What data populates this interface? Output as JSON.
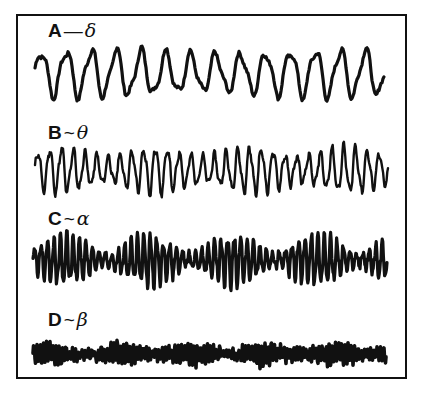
{
  "figure": {
    "line_color": "#111111",
    "background": "#ffffff",
    "frame_color": "#111111"
  },
  "traces": [
    {
      "letter": "A",
      "separator": "—",
      "greek": "δ",
      "name": "delta",
      "frequency": "lowest",
      "amplitude": "large",
      "cycles": 14
    },
    {
      "letter": "B",
      "separator": "~",
      "greek": "θ",
      "name": "theta",
      "frequency": "low",
      "amplitude": "medium-large",
      "cycles": 30
    },
    {
      "letter": "C",
      "separator": "~",
      "greek": "α",
      "name": "alpha",
      "frequency": "medium",
      "amplitude": "waxing-waning spindles",
      "cycles": 55
    },
    {
      "letter": "D",
      "separator": "~",
      "greek": "β",
      "name": "beta",
      "frequency": "highest",
      "amplitude": "small",
      "cycles": 110
    }
  ]
}
